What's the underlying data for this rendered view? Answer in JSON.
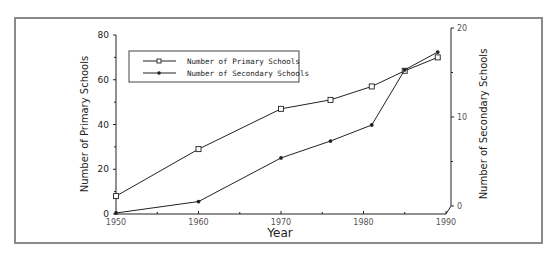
{
  "chart_data": {
    "type": "line",
    "title": "",
    "xlabel": "Year",
    "ylabel": "Number of Primary Schools",
    "ylabel_right": "Number of Secondary Schools",
    "x_ticks": [
      "1950",
      "1960",
      "1970",
      "1980",
      "1990"
    ],
    "y_ticks_left": [
      "0",
      "20",
      "40",
      "60",
      "80"
    ],
    "y_ticks_right": [
      "0",
      "10",
      "20"
    ],
    "xlim": [
      1950,
      1990
    ],
    "ylim_left": [
      0,
      80
    ],
    "ylim_right": [
      0,
      20
    ],
    "grid": false,
    "legend_position": "upper-left (inside plot)",
    "x": [
      1950,
      1960,
      1970,
      1976,
      1981,
      1985,
      1989
    ],
    "series": [
      {
        "name": "Number of Primary Schools",
        "axis": "left",
        "marker": "open-square",
        "values": [
          8,
          29,
          47,
          51,
          57,
          64,
          70
        ]
      },
      {
        "name": "Number of Secondary Schools",
        "axis": "right",
        "marker": "filled-dot",
        "values": [
          0,
          0.5,
          5.4,
          7.3,
          9.1,
          15.3,
          17.3
        ]
      }
    ]
  },
  "legend": {
    "items": [
      {
        "label": "Number of Primary Schools"
      },
      {
        "label": "Number of Secondary Schools"
      }
    ]
  }
}
